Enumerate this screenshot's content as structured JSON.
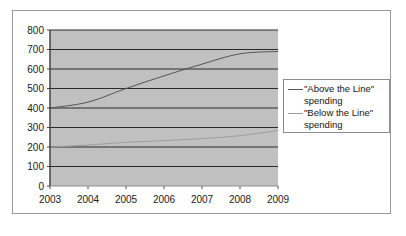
{
  "chart_data": {
    "type": "line",
    "title": "",
    "subtitle": "",
    "xlabel": "",
    "ylabel": "",
    "categories": [
      "2003",
      "2004",
      "2005",
      "2006",
      "2007",
      "2008",
      "2009"
    ],
    "x": [
      2003,
      2004,
      2005,
      2006,
      2007,
      2008,
      2009
    ],
    "xlim": [
      2003,
      2009
    ],
    "ylim": [
      0,
      800
    ],
    "y_ticks": [
      0,
      100,
      200,
      300,
      400,
      500,
      600,
      700,
      800
    ],
    "y_tick_labels": [
      "0",
      "100",
      "200",
      "300",
      "400",
      "500",
      "600",
      "700",
      "800"
    ],
    "y_tick_step": 100,
    "grid": true,
    "grid_orientation": "horizontal",
    "legend_position": "right",
    "plot_background": "#c0c0c0",
    "series": [
      {
        "name": "\"Above the Line\" spending",
        "color": "#555555",
        "values": [
          400,
          430,
          500,
          565,
          625,
          678,
          690
        ]
      },
      {
        "name": "\"Below the Line\" spending",
        "color": "#9e9e9e",
        "values": [
          200,
          210,
          224,
          233,
          243,
          258,
          285
        ]
      }
    ]
  },
  "legend": {
    "entries": [
      {
        "label": "\"Above the Line\"\nspending",
        "swatch": "above"
      },
      {
        "label": "\"Below the Line\"\nspending",
        "swatch": "below"
      }
    ]
  }
}
